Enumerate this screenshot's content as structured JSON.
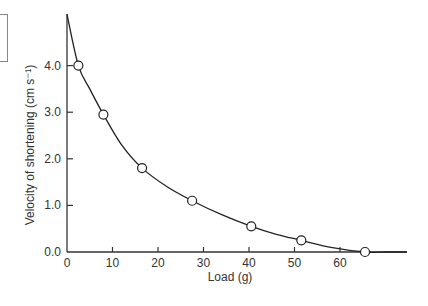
{
  "chart_data": {
    "type": "line",
    "title": "",
    "xlabel": "Load (g)",
    "ylabel": "Velocity of shortening (cm s⁻¹)",
    "xlim": [
      0,
      72
    ],
    "ylim": [
      0,
      5.2
    ],
    "grid": false,
    "legend": "none",
    "x_ticks": [
      0,
      10,
      20,
      30,
      40,
      50,
      60
    ],
    "x_tick_labels": [
      "0",
      "10",
      "20",
      "30",
      "40",
      "50",
      "60"
    ],
    "y_ticks": [
      0,
      1,
      2,
      3,
      4
    ],
    "y_tick_labels": [
      "0.0",
      "1.0",
      "2.0",
      "3.0",
      "4.0"
    ],
    "series": [
      {
        "name": "measured",
        "style": "open-circle markers",
        "x": [
          2.5,
          8,
          16.5,
          27.5,
          40.5,
          51.5,
          65.5
        ],
        "y": [
          4.0,
          2.95,
          1.8,
          1.1,
          0.55,
          0.25,
          0.0
        ]
      },
      {
        "name": "fitted curve",
        "style": "solid line",
        "x": [
          0,
          2.5,
          5,
          8,
          12,
          16.5,
          22,
          27.5,
          34,
          40.5,
          46,
          51.5,
          58,
          65.5,
          70
        ],
        "y": [
          5.1,
          4.0,
          3.5,
          2.95,
          2.3,
          1.8,
          1.4,
          1.1,
          0.8,
          0.55,
          0.38,
          0.25,
          0.1,
          0.0,
          0.0
        ]
      }
    ]
  }
}
